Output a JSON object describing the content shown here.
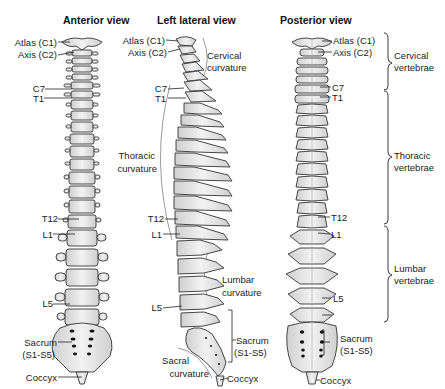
{
  "views": {
    "anterior": {
      "title": "Anterior view",
      "labels": {
        "atlas": "Atlas (C1)",
        "axis": "Axis (C2)",
        "c7": "C7",
        "t1": "T1",
        "t12": "T12",
        "l1": "L1",
        "l5": "L5",
        "sacrum_line1": "Sacrum",
        "sacrum_line2": "(S1-S5)",
        "coccyx": "Coccyx"
      }
    },
    "lateral": {
      "title": "Left lateral view",
      "labels": {
        "atlas": "Atlas (C1)",
        "axis": "Axis (C2)",
        "c7": "C7",
        "t1": "T1",
        "t12": "T12",
        "l1": "L1",
        "l5": "L5",
        "sacrum_line1": "Sacrum",
        "sacrum_line2": "(S1-S5)",
        "coccyx": "Coccyx"
      },
      "curvatures": {
        "cervical_line1": "Cervical",
        "cervical_line2": "curvature",
        "thoracic_line1": "Thoracic",
        "thoracic_line2": "curvature",
        "lumbar_line1": "Lumbar",
        "lumbar_line2": "curvature",
        "sacral_line1": "Sacral",
        "sacral_line2": "curvature"
      }
    },
    "posterior": {
      "title": "Posterior view",
      "labels": {
        "atlas": "Atlas (C1)",
        "axis": "Axis (C2)",
        "c7": "C7",
        "t1": "T1",
        "t12": "T12",
        "l1": "L1",
        "l5": "L5",
        "sacrum_line1": "Sacrum",
        "sacrum_line2": "(S1-S5)",
        "coccyx": "Coccyx"
      }
    }
  },
  "regions": {
    "cervical_line1": "Cervical",
    "cervical_line2": "vertebrae",
    "thoracic_line1": "Thoracic",
    "thoracic_line2": "vertebrae",
    "lumbar_line1": "Lumbar",
    "lumbar_line2": "vertebrae"
  },
  "colors": {
    "bone": "#e4e4e4",
    "bone_outline": "#333333",
    "curve_line": "#9a9a9a",
    "text": "#222222"
  }
}
